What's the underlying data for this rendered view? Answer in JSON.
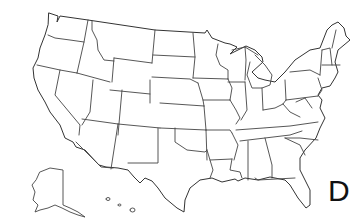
{
  "map": {
    "title": "United States outline map",
    "type": "us-states-outline",
    "line_color": "#444444",
    "background": "#ffffff",
    "includes_insets": [
      "Alaska",
      "Hawaii"
    ]
  },
  "label": {
    "text": "D"
  }
}
